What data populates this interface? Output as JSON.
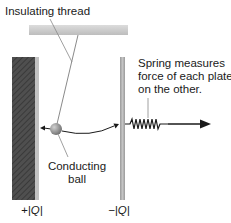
{
  "title_label": "Insulating thread",
  "spring_label": {
    "line1": "Spring measures",
    "line2": "force of each plate",
    "line3": "on the other."
  },
  "ball_label": {
    "line1": "Conducting",
    "line2": "ball"
  },
  "plates": {
    "left_charge": "+|Q|",
    "right_charge": "−|Q|"
  },
  "colors": {
    "ceiling": "#c9c9c9",
    "left_plate_dark": "#4a4a4a",
    "left_plate_strip": "#bdbdbd",
    "right_plate": "#a8a8a8",
    "ball": "#8a8a8a",
    "ink": "#1a1a1a",
    "thread": "#888888"
  }
}
